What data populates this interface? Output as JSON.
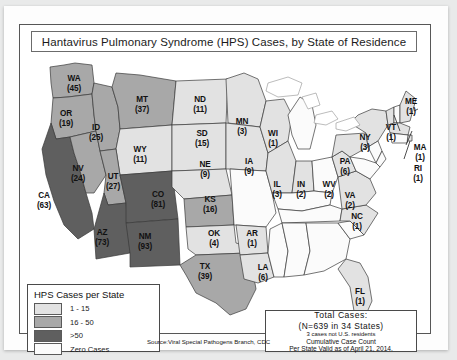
{
  "figure": {
    "title": "Hantavirus Pulmonary Syndrome (HPS) Cases, by State of Residence",
    "source": "Source:Viral Special Pathogens Branch, CDC"
  },
  "legend": {
    "title": "HPS Cases per State",
    "items": [
      {
        "label": "1 - 15",
        "color": "#e2e2e2"
      },
      {
        "label": "16 - 50",
        "color": "#a8a8a8"
      },
      {
        "label": ">50",
        "color": "#5f5f5f"
      },
      {
        "label": "Zero Cases",
        "color": "#fbfbfb"
      }
    ]
  },
  "totals": {
    "title": "Total Cases:",
    "count_line": "(N=639 in 34 States)",
    "note": "3 cases not U.S. residents",
    "cumulative": "Cumulative Case Count",
    "valid": "Per State Valid as of April 21, 2014."
  },
  "chart_data": {
    "type": "map",
    "title": "Hantavirus Pulmonary Syndrome (HPS) Cases, by State of Residence",
    "value_label": "HPS Cases per State",
    "total_cases": 639,
    "states_with_cases": 34,
    "non_resident_cases": 3,
    "valid_as_of": "April 21, 2014",
    "bins": [
      "1 - 15",
      "16 - 50",
      ">50",
      "Zero Cases"
    ],
    "states": [
      {
        "code": "WA",
        "value": 45,
        "bin": "16 - 50",
        "x": 54,
        "y": 27
      },
      {
        "code": "OR",
        "value": 19,
        "bin": "16 - 50",
        "x": 46,
        "y": 62
      },
      {
        "code": "ID",
        "value": 25,
        "bin": "16 - 50",
        "x": 76,
        "y": 76
      },
      {
        "code": "MT",
        "value": 37,
        "bin": "16 - 50",
        "x": 122,
        "y": 48
      },
      {
        "code": "NV",
        "value": 24,
        "bin": "16 - 50",
        "x": 58,
        "y": 117
      },
      {
        "code": "UT",
        "value": 27,
        "bin": "16 - 50",
        "x": 93,
        "y": 125
      },
      {
        "code": "CA",
        "value": 63,
        "bin": ">50",
        "x": 24,
        "y": 144
      },
      {
        "code": "AZ",
        "value": 73,
        "bin": ">50",
        "x": 82,
        "y": 181
      },
      {
        "code": "NM",
        "value": 93,
        "bin": ">50",
        "x": 125,
        "y": 185
      },
      {
        "code": "CO",
        "value": 81,
        "bin": ">50",
        "x": 138,
        "y": 143
      },
      {
        "code": "WY",
        "value": 11,
        "bin": "1 - 15",
        "x": 120,
        "y": 98
      },
      {
        "code": "ND",
        "value": 11,
        "bin": "1 - 15",
        "x": 180,
        "y": 48
      },
      {
        "code": "SD",
        "value": 15,
        "bin": "1 - 15",
        "x": 182,
        "y": 82
      },
      {
        "code": "NE",
        "value": 9,
        "bin": "1 - 15",
        "x": 185,
        "y": 113
      },
      {
        "code": "KS",
        "value": 16,
        "bin": "16 - 50",
        "x": 190,
        "y": 148
      },
      {
        "code": "OK",
        "value": 4,
        "bin": "1 - 15",
        "x": 194,
        "y": 182
      },
      {
        "code": "TX",
        "value": 39,
        "bin": "16 - 50",
        "x": 185,
        "y": 215
      },
      {
        "code": "MN",
        "value": 3,
        "bin": "1 - 15",
        "x": 222,
        "y": 70
      },
      {
        "code": "IA",
        "value": 9,
        "bin": "1 - 15",
        "x": 229,
        "y": 110
      },
      {
        "code": "WI",
        "value": 1,
        "bin": "1 - 15",
        "x": 253,
        "y": 82
      },
      {
        "code": "IL",
        "value": 3,
        "bin": "1 - 15",
        "x": 257,
        "y": 133
      },
      {
        "code": "IN",
        "value": 2,
        "bin": "1 - 15",
        "x": 281,
        "y": 133
      },
      {
        "code": "AR",
        "value": 1,
        "bin": "1 - 15",
        "x": 232,
        "y": 182
      },
      {
        "code": "LA",
        "value": 6,
        "bin": "1 - 15",
        "x": 243,
        "y": 216
      },
      {
        "code": "WV",
        "value": 2,
        "bin": "1 - 15",
        "x": 309,
        "y": 133
      },
      {
        "code": "VA",
        "value": 2,
        "bin": "1 - 15",
        "x": 330,
        "y": 144
      },
      {
        "code": "NC",
        "value": 1,
        "bin": "1 - 15",
        "x": 337,
        "y": 165
      },
      {
        "code": "PA",
        "value": 6,
        "bin": "1 - 15",
        "x": 325,
        "y": 110
      },
      {
        "code": "NY",
        "value": 3,
        "bin": "1 - 15",
        "x": 345,
        "y": 86
      },
      {
        "code": "VT",
        "value": 1,
        "bin": "1 - 15",
        "x": 371,
        "y": 76
      },
      {
        "code": "ME",
        "value": 1,
        "bin": "1 - 15",
        "x": 391,
        "y": 50
      },
      {
        "code": "MA",
        "value": 1,
        "bin": "1 - 15",
        "x": 400,
        "y": 96
      },
      {
        "code": "RI",
        "value": 1,
        "bin": "1 - 15",
        "x": 398,
        "y": 117
      },
      {
        "code": "FL",
        "value": 1,
        "bin": "1 - 15",
        "x": 340,
        "y": 240
      }
    ]
  }
}
